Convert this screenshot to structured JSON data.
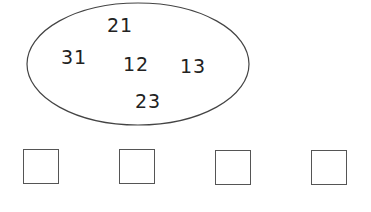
{
  "set": {
    "numbers": [
      {
        "value": "21",
        "x": 120,
        "y": 25
      },
      {
        "value": "31",
        "x": 74,
        "y": 57
      },
      {
        "value": "12",
        "x": 136,
        "y": 64
      },
      {
        "value": "13",
        "x": 193,
        "y": 66
      },
      {
        "value": "23",
        "x": 148,
        "y": 101
      }
    ]
  },
  "answer_boxes": [
    {
      "x": 23,
      "y": 149
    },
    {
      "x": 119,
      "y": 149
    },
    {
      "x": 215,
      "y": 150
    },
    {
      "x": 311,
      "y": 150
    }
  ]
}
